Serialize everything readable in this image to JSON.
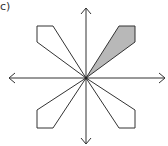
{
  "figure": {
    "label": "c)",
    "center": [
      86,
      78
    ],
    "axes": {
      "horizontal": {
        "from": [
          9,
          78
        ],
        "to": [
          165,
          78
        ]
      },
      "vertical": {
        "from": [
          86,
          8
        ],
        "to": [
          86,
          144
        ]
      }
    },
    "shapes": [
      {
        "name": "upper-left-kite",
        "points": "86,78 37,42 37,26 53,26",
        "fill": "#ffffff"
      },
      {
        "name": "upper-right-kite-shaded",
        "points": "86,78 119,26 135,26 135,42",
        "fill": "#b8b8b8"
      },
      {
        "name": "lower-left-kite",
        "points": "86,78 37,110 37,128 53,128",
        "fill": "#ffffff"
      },
      {
        "name": "lower-right-kite",
        "points": "86,78 119,128 135,128 135,110",
        "fill": "#ffffff"
      }
    ],
    "stroke": "#333333"
  }
}
